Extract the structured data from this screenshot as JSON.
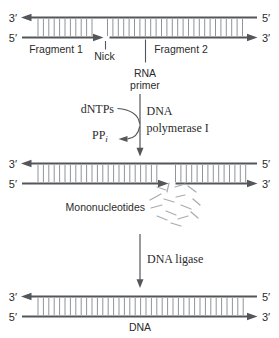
{
  "colors": {
    "strand": "#54565a",
    "rung": "#919396",
    "text": "#2b2b2b",
    "scatter": "#a9abae",
    "background": "#ffffff"
  },
  "stage1": {
    "top_left_end": "3′",
    "top_right_end": "5′",
    "bottom_left_end": "5′",
    "bottom_right_end": "3′",
    "fragment1_label": "Fragment 1",
    "nick_label": "Nick",
    "fragment2_label": "Fragment 2",
    "rna_primer_line1": "RNA",
    "rna_primer_line2": "primer"
  },
  "reaction1": {
    "substrate_label": "dNTPs",
    "byproduct_label": "PP",
    "byproduct_subscript": "i",
    "enzyme_line1": "DNA",
    "enzyme_line2": "polymerase I"
  },
  "stage2": {
    "top_left_end": "3′",
    "top_right_end": "5′",
    "bottom_left_end": "5′",
    "bottom_right_end": "3′",
    "mononucleotides_label": "Mononucleotides"
  },
  "reaction2": {
    "enzyme_label": "DNA ligase"
  },
  "stage3": {
    "top_left_end": "3′",
    "top_right_end": "5′",
    "bottom_left_end": "5′",
    "bottom_right_end": "3′",
    "dna_label": "DNA"
  }
}
